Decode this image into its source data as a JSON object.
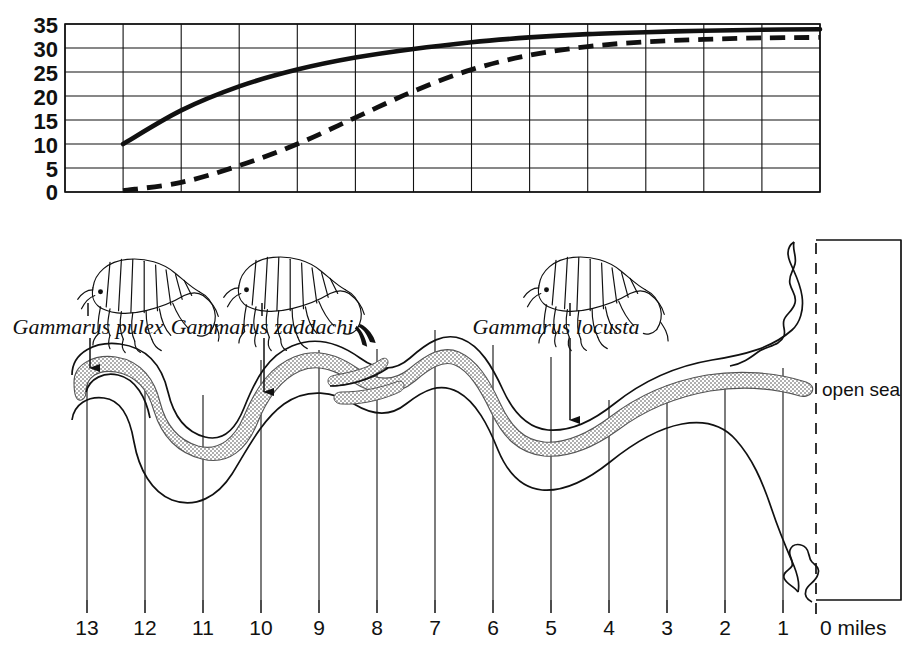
{
  "figure": {
    "open_sea_label": "open sea",
    "miles_label": "0 miles"
  },
  "chart_data": {
    "type": "line",
    "title": "",
    "xlabel": "",
    "ylabel": "",
    "xlim": [
      13,
      0
    ],
    "ylim": [
      0,
      35
    ],
    "grid": true,
    "legend_position": "none",
    "yticks": [
      "0",
      "5",
      "10",
      "15",
      "20",
      "25",
      "30",
      "35"
    ],
    "ytick_values": [
      0,
      5,
      10,
      15,
      20,
      25,
      30,
      35
    ],
    "x": [
      13,
      12,
      11,
      10,
      9,
      8,
      7,
      6,
      5,
      4,
      3,
      2,
      1,
      0
    ],
    "series": [
      {
        "name": "high tide salinity",
        "style": "solid",
        "values": [
          null,
          10.0,
          17.0,
          22.0,
          25.5,
          28.0,
          29.8,
          31.2,
          32.2,
          32.9,
          33.3,
          33.6,
          33.8,
          33.9
        ]
      },
      {
        "name": "low tide salinity",
        "style": "dashed",
        "values": [
          null,
          0.3,
          2.0,
          5.5,
          10.0,
          15.5,
          21.0,
          25.5,
          28.5,
          30.3,
          31.3,
          31.8,
          32.1,
          32.2
        ]
      }
    ]
  },
  "map": {
    "xticks": [
      "13",
      "12",
      "11",
      "10",
      "9",
      "8",
      "7",
      "6",
      "5",
      "4",
      "3",
      "2",
      "1"
    ],
    "xtick_values": [
      13,
      12,
      11,
      10,
      9,
      8,
      7,
      6,
      5,
      4,
      3,
      2,
      1
    ],
    "zero_mile_label": "0 miles",
    "open_sea_label": "open sea",
    "species": [
      {
        "name": "Gammarus pulex",
        "label_x": 88,
        "approx_mile": 13,
        "habitat": "freshwater upper reach"
      },
      {
        "name": "Gammarus zaddachi",
        "label_x": 262,
        "approx_mile": 10,
        "habitat": "brackish middle reach"
      },
      {
        "name": "Gammarus  locusta",
        "label_x": 556,
        "approx_mile": 5,
        "habitat": "marine lower reach"
      }
    ]
  },
  "colors": {
    "ink": "#111111",
    "stipple": "#9a9a9a",
    "stipple_fill": "#c9c9c9",
    "background": "#ffffff"
  }
}
